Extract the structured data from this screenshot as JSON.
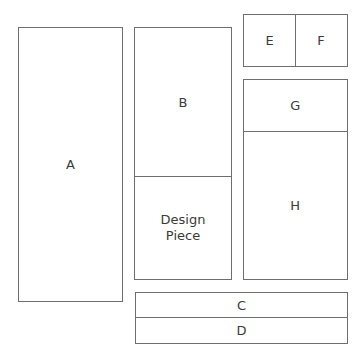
{
  "diagram": {
    "type": "quilt-layout",
    "line_color": "#6e6e6e",
    "text_color": "#3a3a3a",
    "pieces": [
      {
        "id": "A",
        "label": "A"
      },
      {
        "id": "B",
        "label": "B"
      },
      {
        "id": "design",
        "label": "Design\nPiece"
      },
      {
        "id": "C",
        "label": "C"
      },
      {
        "id": "D",
        "label": "D"
      },
      {
        "id": "E",
        "label": "E"
      },
      {
        "id": "F",
        "label": "F"
      },
      {
        "id": "G",
        "label": "G"
      },
      {
        "id": "H",
        "label": "H"
      }
    ]
  }
}
